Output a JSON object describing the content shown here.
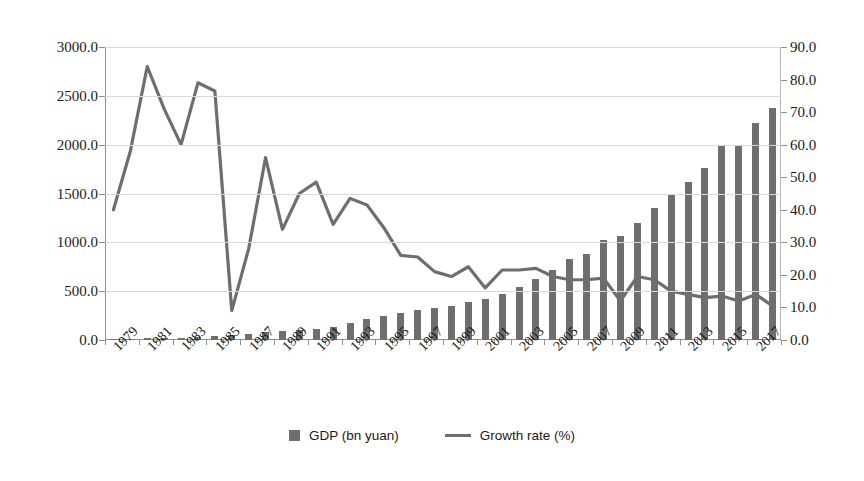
{
  "chart_data": {
    "type": "bar",
    "title": "",
    "subtitle": "",
    "xlabel": "",
    "ylabel": "",
    "grid": true,
    "legend_position": "bottom",
    "x": [
      1979,
      1980,
      1981,
      1982,
      1983,
      1984,
      1985,
      1986,
      1987,
      1988,
      1989,
      1990,
      1991,
      1992,
      1993,
      1994,
      1995,
      1996,
      1997,
      1998,
      1999,
      2000,
      2001,
      2002,
      2003,
      2004,
      2005,
      2006,
      2007,
      2008,
      2009,
      2010,
      2011,
      2012,
      2013,
      2014,
      2015,
      2016,
      2017,
      2018
    ],
    "x_tick_labels": [
      "1979",
      "1981",
      "1983",
      "1985",
      "1987",
      "1989",
      "1991",
      "1993",
      "1995",
      "1997",
      "1999",
      "2001",
      "2003",
      "2005",
      "2007",
      "2009",
      "2011",
      "2013",
      "2015",
      "2017"
    ],
    "axes": {
      "left": {
        "name": "GDP (bn yuan)",
        "min": 0,
        "max": 3000,
        "step": 500,
        "ticks": [
          "0.0",
          "500.0",
          "1000.0",
          "1500.0",
          "2000.0",
          "2500.0",
          "3000.0"
        ]
      },
      "right": {
        "name": "Growth rate (%)",
        "min": 0,
        "max": 90,
        "step": 10,
        "ticks": [
          "0.0",
          "10.0",
          "20.0",
          "30.0",
          "40.0",
          "50.0",
          "60.0",
          "70.0",
          "80.0",
          "90.0"
        ]
      }
    },
    "series": [
      {
        "name": "GDP (bn yuan)",
        "type": "bar",
        "axis": "left",
        "color": "#6e6e6e",
        "values": [
          8,
          12,
          16,
          20,
          25,
          33,
          44,
          52,
          62,
          80,
          92,
          98,
          110,
          135,
          175,
          215,
          250,
          280,
          310,
          330,
          350,
          385,
          420,
          470,
          540,
          620,
          720,
          830,
          880,
          1020,
          1060,
          1200,
          1350,
          1500,
          1620,
          1760,
          1990,
          2000,
          2220,
          2380
        ]
      },
      {
        "name": "Growth rate (%)",
        "type": "line",
        "axis": "right",
        "color": "#6e6e6e",
        "values": [
          40.0,
          58.0,
          84.0,
          71.0,
          60.0,
          79.0,
          76.5,
          9.0,
          28.0,
          56.0,
          34.0,
          45.0,
          48.5,
          35.5,
          43.5,
          41.5,
          34.5,
          26.0,
          25.5,
          21.0,
          19.5,
          22.5,
          16.0,
          21.5,
          21.5,
          22.0,
          19.5,
          18.5,
          18.5,
          19.0,
          12.0,
          19.5,
          18.5,
          15.0,
          14.0,
          13.0,
          13.5,
          12.0,
          14.0,
          10.5
        ]
      }
    ]
  },
  "legend": {
    "items": [
      {
        "label": "GDP (bn yuan)",
        "marker": "square",
        "color": "#6e6e6e"
      },
      {
        "label": "Growth rate (%)",
        "marker": "line",
        "color": "#6e6e6e"
      }
    ]
  }
}
